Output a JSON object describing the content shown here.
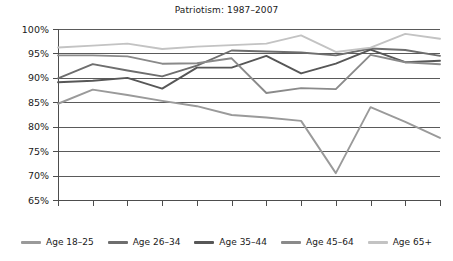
{
  "chart_data": {
    "type": "line",
    "title": "Patriotism: 1987–2007",
    "xlabel": "",
    "ylabel": "",
    "ylim": [
      65,
      100
    ],
    "ytick_step": 5,
    "ytick_labels": [
      "100%",
      "95%",
      "90%",
      "85%",
      "80%",
      "75%",
      "70%",
      "65%"
    ],
    "yticks": [
      100,
      95,
      90,
      85,
      80,
      75,
      70,
      65
    ],
    "grid": true,
    "legend_position": "bottom",
    "categories": [
      "1987",
      "1988",
      "1989",
      "1990",
      "1991",
      "1992",
      "1994",
      "1997",
      "1999",
      "2002",
      "2003",
      "2007"
    ],
    "series": [
      {
        "name": "Age 18–25",
        "color": "#9a9a9a",
        "values": [
          84.7,
          87.6,
          86.5,
          85.3,
          84.2,
          82.4,
          81.9,
          81.2,
          70.5,
          84.0,
          81.0,
          77.7
        ]
      },
      {
        "name": "Age 26–34",
        "color": "#6e6e6e",
        "values": [
          89.9,
          92.8,
          91.5,
          90.3,
          92.5,
          95.6,
          95.4,
          95.2,
          94.6,
          96.0,
          95.7,
          94.5
        ]
      },
      {
        "name": "Age 35–44",
        "color": "#575757",
        "values": [
          89.1,
          89.4,
          90.0,
          87.8,
          92.1,
          92.1,
          94.5,
          90.9,
          92.9,
          95.8,
          93.2,
          93.5
        ]
      },
      {
        "name": "Age 45–64",
        "color": "#8a8a8a",
        "values": [
          94.6,
          94.6,
          94.4,
          92.9,
          93.0,
          94.0,
          86.9,
          87.9,
          87.7,
          94.7,
          93.2,
          92.8
        ]
      },
      {
        "name": "Age 65+",
        "color": "#c3c3c3",
        "values": [
          96.2,
          96.6,
          97.0,
          95.9,
          96.4,
          96.7,
          97.0,
          98.7,
          95.3,
          96.2,
          99.0,
          98.0
        ]
      }
    ]
  },
  "legend": {
    "items": [
      {
        "label": "Age 18–25"
      },
      {
        "label": "Age 26–34"
      },
      {
        "label": "Age 35–44"
      },
      {
        "label": "Age 45–64"
      },
      {
        "label": "Age 65+"
      }
    ]
  }
}
